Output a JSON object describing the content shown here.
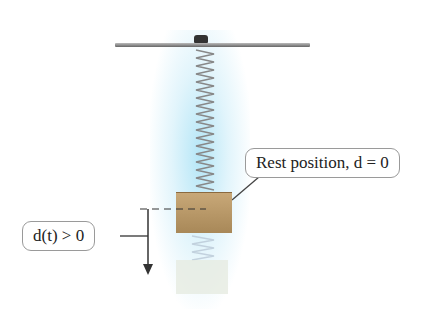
{
  "diagram": {
    "labels": {
      "rest": "Rest position, d = 0",
      "displacement": "d(t) > 0"
    },
    "colors": {
      "glow": "#9fdcf2",
      "block": "#b8986a",
      "line": "#333333",
      "border": "#9a9a9a"
    }
  }
}
